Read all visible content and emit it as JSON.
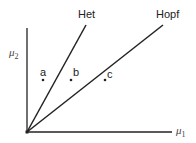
{
  "diagram": {
    "type": "bifurcation-parameter-plane",
    "axes": {
      "x": {
        "symbol": "μ",
        "subscript": "1"
      },
      "y": {
        "symbol": "μ",
        "subscript": "2"
      }
    },
    "curves": [
      {
        "id": "het",
        "label": "Het"
      },
      {
        "id": "hopf",
        "label": "Hopf"
      }
    ],
    "points": [
      {
        "id": "a",
        "label": "a"
      },
      {
        "id": "b",
        "label": "b"
      },
      {
        "id": "c",
        "label": "c"
      }
    ],
    "colors": {
      "line": "#222222",
      "text": "#222222",
      "background": "#ffffff"
    }
  }
}
